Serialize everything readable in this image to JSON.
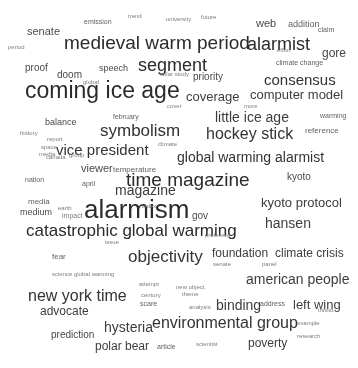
{
  "visual": {
    "type": "word-cloud",
    "background": "#ffffff",
    "ink": "#3a3a3a",
    "width": 358,
    "height": 368,
    "note": "Grayscale tag/word cloud of climate-change media terms, low-resolution scan"
  },
  "chart_data": {
    "type": "word-cloud",
    "title": "",
    "words": [
      {
        "text": "alarmism",
        "size": 26,
        "x": 84,
        "y": 196,
        "tier": 1
      },
      {
        "text": "coming ice age",
        "size": 23,
        "x": 25,
        "y": 79,
        "tier": 1
      },
      {
        "text": "medieval warm period",
        "size": 19,
        "x": 64,
        "y": 33,
        "tier": 1
      },
      {
        "text": "time magazine",
        "size": 19,
        "x": 126,
        "y": 170,
        "tier": 1
      },
      {
        "text": "catastrophic global warming",
        "size": 17,
        "x": 26,
        "y": 222,
        "tier": 1
      },
      {
        "text": "segment",
        "size": 18,
        "x": 138,
        "y": 56,
        "tier": 1
      },
      {
        "text": "alarmist",
        "size": 18,
        "x": 247,
        "y": 35,
        "tier": 1
      },
      {
        "text": "symbolism",
        "size": 17,
        "x": 100,
        "y": 122,
        "tier": 2
      },
      {
        "text": "objectivity",
        "size": 17,
        "x": 128,
        "y": 248,
        "tier": 2
      },
      {
        "text": "environmental group",
        "size": 16,
        "x": 152,
        "y": 315,
        "tier": 2
      },
      {
        "text": "hockey stick",
        "size": 16,
        "x": 206,
        "y": 126,
        "tier": 2
      },
      {
        "text": "global warming alarmist",
        "size": 14,
        "x": 177,
        "y": 150,
        "tier": 2
      },
      {
        "text": "new york time",
        "size": 16,
        "x": 28,
        "y": 288,
        "tier": 2
      },
      {
        "text": "vice president",
        "size": 15,
        "x": 56,
        "y": 142,
        "tier": 2
      },
      {
        "text": "consensus",
        "size": 15,
        "x": 264,
        "y": 72,
        "tier": 2
      },
      {
        "text": "american people",
        "size": 14,
        "x": 246,
        "y": 272,
        "tier": 3
      },
      {
        "text": "little ice age",
        "size": 14,
        "x": 215,
        "y": 110,
        "tier": 3
      },
      {
        "text": "computer model",
        "size": 13,
        "x": 250,
        "y": 88,
        "tier": 3
      },
      {
        "text": "kyoto protocol",
        "size": 13,
        "x": 261,
        "y": 196,
        "tier": 3
      },
      {
        "text": "hysteria",
        "size": 14,
        "x": 104,
        "y": 320,
        "tier": 3
      },
      {
        "text": "binding",
        "size": 14,
        "x": 216,
        "y": 298,
        "tier": 3
      },
      {
        "text": "left wing",
        "size": 13,
        "x": 293,
        "y": 298,
        "tier": 3
      },
      {
        "text": "hansen",
        "size": 14,
        "x": 265,
        "y": 216,
        "tier": 3
      },
      {
        "text": "climate crisis",
        "size": 12,
        "x": 275,
        "y": 247,
        "tier": 3
      },
      {
        "text": "coverage",
        "size": 13,
        "x": 186,
        "y": 90,
        "tier": 3
      },
      {
        "text": "foundation",
        "size": 12,
        "x": 212,
        "y": 247,
        "tier": 3
      },
      {
        "text": "polar bear",
        "size": 12,
        "x": 95,
        "y": 340,
        "tier": 3
      },
      {
        "text": "advocate",
        "size": 12,
        "x": 40,
        "y": 305,
        "tier": 3
      },
      {
        "text": "poverty",
        "size": 12,
        "x": 248,
        "y": 337,
        "tier": 3
      },
      {
        "text": "magazine",
        "size": 14,
        "x": 115,
        "y": 183,
        "tier": 3
      },
      {
        "text": "viewer",
        "size": 11,
        "x": 81,
        "y": 163,
        "tier": 4
      },
      {
        "text": "prediction",
        "size": 10,
        "x": 51,
        "y": 330,
        "tier": 4
      },
      {
        "text": "senate",
        "size": 11,
        "x": 27,
        "y": 26,
        "tier": 4
      },
      {
        "text": "gore",
        "size": 12,
        "x": 322,
        "y": 47,
        "tier": 4
      },
      {
        "text": "web",
        "size": 11,
        "x": 256,
        "y": 18,
        "tier": 4
      },
      {
        "text": "priority",
        "size": 10,
        "x": 193,
        "y": 72,
        "tier": 4
      },
      {
        "text": "proof",
        "size": 10,
        "x": 25,
        "y": 63,
        "tier": 4
      },
      {
        "text": "doom",
        "size": 10,
        "x": 57,
        "y": 70,
        "tier": 4
      },
      {
        "text": "speech",
        "size": 9,
        "x": 99,
        "y": 64,
        "tier": 4
      },
      {
        "text": "balance",
        "size": 9,
        "x": 45,
        "y": 118,
        "tier": 4
      },
      {
        "text": "temperature",
        "size": 8,
        "x": 113,
        "y": 166,
        "tier": 5
      },
      {
        "text": "kyoto",
        "size": 10,
        "x": 287,
        "y": 172,
        "tier": 4
      },
      {
        "text": "gov",
        "size": 10,
        "x": 192,
        "y": 211,
        "tier": 4
      },
      {
        "text": "medium",
        "size": 9,
        "x": 20,
        "y": 208,
        "tier": 4
      },
      {
        "text": "media",
        "size": 8,
        "x": 28,
        "y": 198,
        "tier": 5
      },
      {
        "text": "nation",
        "size": 7,
        "x": 25,
        "y": 176,
        "tier": 5
      },
      {
        "text": "climate change",
        "size": 7,
        "x": 276,
        "y": 59,
        "tier": 5
      },
      {
        "text": "reference",
        "size": 8,
        "x": 305,
        "y": 127,
        "tier": 5
      },
      {
        "text": "february",
        "size": 7,
        "x": 113,
        "y": 113,
        "tier": 5
      },
      {
        "text": "april",
        "size": 7,
        "x": 82,
        "y": 180,
        "tier": 5
      },
      {
        "text": "claim",
        "size": 7,
        "x": 318,
        "y": 26,
        "tier": 5
      },
      {
        "text": "addition",
        "size": 9,
        "x": 288,
        "y": 20,
        "tier": 5
      },
      {
        "text": "warming",
        "size": 7,
        "x": 320,
        "y": 112,
        "tier": 5
      },
      {
        "text": "fear",
        "size": 8,
        "x": 52,
        "y": 253,
        "tier": 5
      },
      {
        "text": "professor",
        "size": 6,
        "x": 205,
        "y": 232,
        "tier": 6
      },
      {
        "text": "article",
        "size": 7,
        "x": 157,
        "y": 343,
        "tier": 5
      },
      {
        "text": "scientist",
        "size": 6,
        "x": 196,
        "y": 341,
        "tier": 6
      },
      {
        "text": "scare",
        "size": 7,
        "x": 140,
        "y": 300,
        "tier": 5
      },
      {
        "text": "theme",
        "size": 6,
        "x": 182,
        "y": 291,
        "tier": 6
      },
      {
        "text": "analysis",
        "size": 6,
        "x": 189,
        "y": 304,
        "tier": 6
      },
      {
        "text": "address",
        "size": 7,
        "x": 260,
        "y": 300,
        "tier": 5
      },
      {
        "text": "example",
        "size": 6,
        "x": 297,
        "y": 320,
        "tier": 6
      },
      {
        "text": "research",
        "size": 6,
        "x": 297,
        "y": 333,
        "tier": 6
      },
      {
        "text": "threat",
        "size": 6,
        "x": 318,
        "y": 307,
        "tier": 6
      },
      {
        "text": "new object",
        "size": 6,
        "x": 176,
        "y": 284,
        "tier": 6
      },
      {
        "text": "science global warming",
        "size": 6,
        "x": 52,
        "y": 271,
        "tier": 6
      },
      {
        "text": "attempt",
        "size": 6,
        "x": 139,
        "y": 281,
        "tier": 6
      },
      {
        "text": "century",
        "size": 6,
        "x": 141,
        "y": 292,
        "tier": 6
      },
      {
        "text": "emission",
        "size": 7,
        "x": 84,
        "y": 18,
        "tier": 5
      },
      {
        "text": "university",
        "size": 6,
        "x": 166,
        "y": 16,
        "tier": 6
      },
      {
        "text": "future",
        "size": 6,
        "x": 201,
        "y": 14,
        "tier": 6
      },
      {
        "text": "solar study",
        "size": 6,
        "x": 160,
        "y": 71,
        "tier": 6
      },
      {
        "text": "history",
        "size": 6,
        "x": 20,
        "y": 130,
        "tier": 6
      },
      {
        "text": "canada",
        "size": 6,
        "x": 46,
        "y": 154,
        "tier": 6
      },
      {
        "text": "report",
        "size": 6,
        "x": 47,
        "y": 136,
        "tier": 6
      },
      {
        "text": "climate",
        "size": 6,
        "x": 158,
        "y": 141,
        "tier": 6
      },
      {
        "text": "panel",
        "size": 6,
        "x": 262,
        "y": 261,
        "tier": 6
      },
      {
        "text": "senate",
        "size": 6,
        "x": 213,
        "y": 261,
        "tier": 6
      },
      {
        "text": "impact",
        "size": 7,
        "x": 62,
        "y": 212,
        "tier": 6
      },
      {
        "text": "earth",
        "size": 6,
        "x": 58,
        "y": 205,
        "tier": 6
      },
      {
        "text": "index",
        "size": 6,
        "x": 142,
        "y": 203,
        "tier": 6
      },
      {
        "text": "global",
        "size": 6,
        "x": 83,
        "y": 79,
        "tier": 6
      },
      {
        "text": "cover",
        "size": 6,
        "x": 167,
        "y": 103,
        "tier": 6
      },
      {
        "text": "effort",
        "size": 6,
        "x": 277,
        "y": 47,
        "tier": 6
      },
      {
        "text": "more",
        "size": 6,
        "x": 244,
        "y": 103,
        "tier": 6
      },
      {
        "text": "issue",
        "size": 6,
        "x": 105,
        "y": 239,
        "tier": 6
      },
      {
        "text": "space",
        "size": 6,
        "x": 41,
        "y": 144,
        "tier": 6
      },
      {
        "text": "media",
        "size": 6,
        "x": 39,
        "y": 151,
        "tier": 6
      },
      {
        "text": "group",
        "size": 6,
        "x": 69,
        "y": 152,
        "tier": 6
      },
      {
        "text": "trend",
        "size": 6,
        "x": 128,
        "y": 13,
        "tier": 6
      },
      {
        "text": "period",
        "size": 6,
        "x": 8,
        "y": 44,
        "tier": 6
      }
    ]
  }
}
